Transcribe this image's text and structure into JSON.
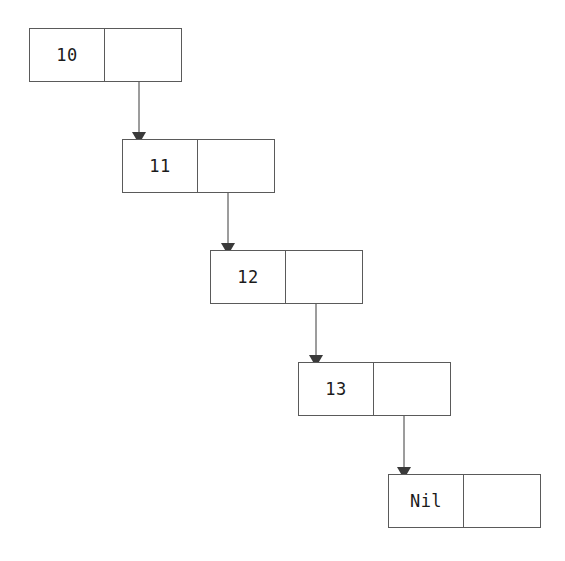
{
  "diagram": {
    "type": "linked-list",
    "canvas": {
      "width": 565,
      "height": 561,
      "background": "#ffffff"
    },
    "style": {
      "stroke": "#5a5a5a",
      "edge_stroke": "#3a3a3a",
      "text_color": "#1b1b1b",
      "node_fill": "#ffffff",
      "node_width": 153,
      "node_height": 54,
      "stroke_width": 1
    },
    "nodes": [
      {
        "id": "n0",
        "label": "10",
        "x": 29,
        "y": 28,
        "value_cell_width": 76,
        "next_cell_width": 77,
        "next_label": ""
      },
      {
        "id": "n1",
        "label": "11",
        "x": 122,
        "y": 139,
        "value_cell_width": 76,
        "next_cell_width": 77,
        "next_label": ""
      },
      {
        "id": "n2",
        "label": "12",
        "x": 210,
        "y": 250,
        "value_cell_width": 76,
        "next_cell_width": 77,
        "next_label": ""
      },
      {
        "id": "n3",
        "label": "13",
        "x": 298,
        "y": 362,
        "value_cell_width": 76,
        "next_cell_width": 77,
        "next_label": ""
      },
      {
        "id": "n4",
        "label": "Nil",
        "x": 388,
        "y": 474,
        "value_cell_width": 76,
        "next_cell_width": 77,
        "next_label": ""
      }
    ],
    "edges": [
      {
        "id": "e0",
        "from": "n0",
        "to": "n1",
        "x1": 139,
        "y1": 82,
        "x2": 139,
        "y2": 132,
        "arrow": "down"
      },
      {
        "id": "e1",
        "from": "n1",
        "to": "n2",
        "x1": 228,
        "y1": 193,
        "x2": 228,
        "y2": 243,
        "arrow": "down"
      },
      {
        "id": "e2",
        "from": "n2",
        "to": "n3",
        "x1": 316,
        "y1": 304,
        "x2": 316,
        "y2": 355,
        "arrow": "down"
      },
      {
        "id": "e3",
        "from": "n3",
        "to": "n4",
        "x1": 404,
        "y1": 416,
        "x2": 404,
        "y2": 467,
        "arrow": "down"
      }
    ]
  }
}
